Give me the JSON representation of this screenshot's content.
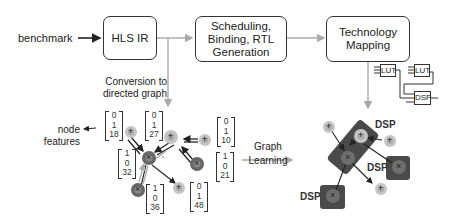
{
  "input": {
    "label": "benchmark"
  },
  "stages": [
    {
      "id": "hls-ir",
      "label": "HLS IR"
    },
    {
      "id": "scheduling",
      "label": "Scheduling, Binding, RTL Generation"
    },
    {
      "id": "tech-mapping",
      "label": "Technology Mapping"
    }
  ],
  "conversion_label": "Conversion to directed graph",
  "node_features_label": "node features",
  "graph_learning_label": "Graph Learning",
  "feature_vectors": [
    {
      "values": [
        "0",
        "1",
        "18"
      ]
    },
    {
      "values": [
        "0",
        "1",
        "27"
      ]
    },
    {
      "values": [
        "0",
        "1",
        "10"
      ]
    },
    {
      "values": [
        "1",
        "0",
        "32"
      ]
    },
    {
      "values": [
        "1",
        "0",
        "21"
      ]
    },
    {
      "values": [
        "1",
        "0",
        "36"
      ]
    },
    {
      "values": [
        "0",
        "1",
        "48"
      ]
    }
  ],
  "tech_components": [
    {
      "label": "LUT"
    },
    {
      "label": "LUT"
    },
    {
      "label": "DSP"
    }
  ],
  "dsp_labels": [
    "DSP",
    "DSP",
    "DSP"
  ],
  "node_symbols": {
    "add": "+",
    "mul": "×"
  },
  "colors": {
    "add_node": "#c4c4c4",
    "mul_node": "#6e6e6e",
    "dsp_group": "#4a4a4a",
    "arrow_gray": "#a8a8a8",
    "arrow_dark": "#222222"
  }
}
